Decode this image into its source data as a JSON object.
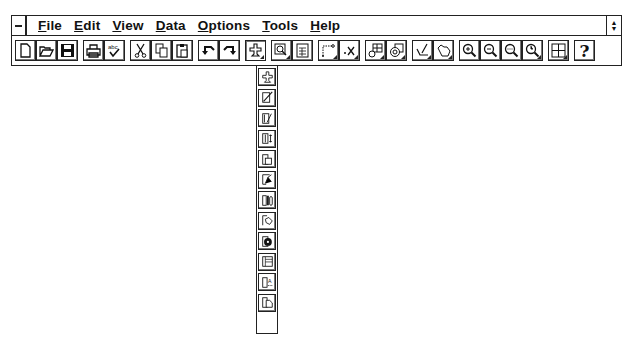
{
  "menubar": {
    "items": [
      {
        "label": "File",
        "mnemonic": "F"
      },
      {
        "label": "Edit",
        "mnemonic": "E"
      },
      {
        "label": "View",
        "mnemonic": "V"
      },
      {
        "label": "Data",
        "mnemonic": "D"
      },
      {
        "label": "Options",
        "mnemonic": "O"
      },
      {
        "label": "Tools",
        "mnemonic": "T"
      },
      {
        "label": "Help",
        "mnemonic": "H"
      }
    ]
  },
  "toolbar": {
    "buttons": [
      {
        "icon": "new-document-icon"
      },
      {
        "icon": "open-folder-icon"
      },
      {
        "icon": "save-disk-icon"
      },
      {
        "icon": "print-icon"
      },
      {
        "icon": "spell-check-icon",
        "text": "abc"
      },
      {
        "icon": "cut-scissors-icon"
      },
      {
        "icon": "copy-icon"
      },
      {
        "icon": "paste-icon"
      },
      {
        "icon": "undo-icon"
      },
      {
        "icon": "redo-icon"
      },
      {
        "icon": "chart-type-icon",
        "has_dropdown": true,
        "active": true
      },
      {
        "icon": "chart-wizard-icon",
        "has_dropdown": true
      },
      {
        "icon": "data-sheet-icon"
      },
      {
        "icon": "axis-icon",
        "has_dropdown": true
      },
      {
        "icon": "series-x-icon",
        "has_dropdown": true
      },
      {
        "icon": "table-grid-icon",
        "has_dropdown": true
      },
      {
        "icon": "color-palette-icon",
        "has_dropdown": true
      },
      {
        "icon": "draw-pencil-icon",
        "has_dropdown": true
      },
      {
        "icon": "hand-pan-icon",
        "has_dropdown": true
      },
      {
        "icon": "zoom-in-icon"
      },
      {
        "icon": "zoom-out-icon"
      },
      {
        "icon": "zoom-fit-icon"
      },
      {
        "icon": "zoom-clock-icon",
        "has_dropdown": true
      },
      {
        "icon": "layout-grid-icon",
        "has_dropdown": true
      },
      {
        "icon": "help-icon",
        "text": "?"
      }
    ]
  },
  "chart_type_dropdown": {
    "items": [
      {
        "icon": "gallery-icon"
      },
      {
        "icon": "line-chart-icon"
      },
      {
        "icon": "area-chart-icon"
      },
      {
        "icon": "range-chart-icon"
      },
      {
        "icon": "stacked-bar-icon"
      },
      {
        "icon": "scatter-chart-icon"
      },
      {
        "icon": "bar-chart-icon"
      },
      {
        "icon": "pie-chart-icon"
      },
      {
        "icon": "doughnut-chart-icon"
      },
      {
        "icon": "table-chart-icon"
      },
      {
        "icon": "text-chart-icon",
        "text": "A"
      },
      {
        "icon": "3d-chart-icon"
      }
    ]
  }
}
